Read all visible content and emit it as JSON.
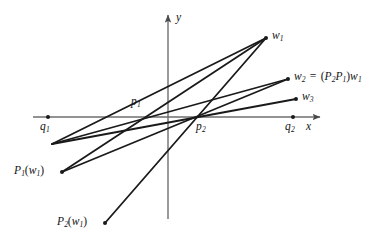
{
  "figure": {
    "type": "geometry-diagram",
    "background": "#ffffff",
    "ink_color": "#1a1a1a",
    "axis_color": "#6e6e6e",
    "width": 391,
    "height": 247,
    "axes": {
      "x_label": "x",
      "y_label": "y",
      "x_axis_y": 117,
      "x_axis_from": 33,
      "x_axis_to": 320,
      "y_axis_x": 168,
      "y_axis_from": 15,
      "y_axis_to": 219
    },
    "points": [
      {
        "name": "q1",
        "label_html": "q<sub>1</sub>",
        "x": 48,
        "y": 117,
        "label_x": 40,
        "label_y": 121,
        "dot": true
      },
      {
        "name": "q2",
        "label_html": "q<sub>2</sub>",
        "x": 293,
        "y": 117,
        "label_x": 285,
        "label_y": 121,
        "dot": true
      },
      {
        "name": "p1",
        "label_html": "p<sub>1</sub>",
        "x": 150,
        "y": 117,
        "label_x": 131,
        "label_y": 96,
        "dot": false
      },
      {
        "name": "p2",
        "label_html": "p<sub>2</sub>",
        "x": 198,
        "y": 117,
        "label_x": 196,
        "label_y": 121,
        "dot": false
      },
      {
        "name": "w1",
        "label_html": "w<sub>1</sub>",
        "x": 266,
        "y": 38,
        "label_x": 272,
        "label_y": 30,
        "dot": true
      },
      {
        "name": "w2",
        "label_html": "w<sub>2</sub> = (P<sub>2</sub>P<sub>1</sub>)w<sub>1</sub>",
        "x": 288,
        "y": 79,
        "label_x": 294,
        "label_y": 71,
        "dot": true
      },
      {
        "name": "w3",
        "label_html": "w<sub>3</sub>",
        "x": 296,
        "y": 99,
        "label_x": 302,
        "label_y": 91,
        "dot": true
      },
      {
        "name": "P1w1",
        "label_html": "P<sub>1</sub>(w<sub>1</sub>)",
        "x": 62,
        "y": 172,
        "label_x": 14,
        "label_y": 165,
        "dot": true
      },
      {
        "name": "P2w1",
        "label_html": "P<sub>2</sub>(w<sub>1</sub>)",
        "x": 105,
        "y": 223,
        "label_x": 57,
        "label_y": 216,
        "dot": true
      },
      {
        "name": "left-end",
        "label_html": "",
        "x": 52,
        "y": 144,
        "label_x": 0,
        "label_y": 0,
        "dot": false
      }
    ],
    "segments": [
      {
        "name": "w1-to-P1w1",
        "x1": 266,
        "y1": 38,
        "x2": 62,
        "y2": 172
      },
      {
        "name": "w1-to-P2w1",
        "x1": 266,
        "y1": 38,
        "x2": 105,
        "y2": 223
      },
      {
        "name": "w1-to-left-end",
        "x1": 266,
        "y1": 38,
        "x2": 52,
        "y2": 144
      },
      {
        "name": "w2-to-P1w1",
        "x1": 288,
        "y1": 79,
        "x2": 62,
        "y2": 172
      },
      {
        "name": "w2-to-left-end",
        "x1": 288,
        "y1": 79,
        "x2": 52,
        "y2": 144
      },
      {
        "name": "w3-to-left-end",
        "x1": 296,
        "y1": 99,
        "x2": 52,
        "y2": 144
      }
    ],
    "labels": {
      "q1": "q1",
      "q2": "q2",
      "p1": "p1",
      "p2": "p2",
      "w1": "w1",
      "w2_expression": "w2 = (P2P1)w1",
      "w3": "w3",
      "P1w1": "P1(w1)",
      "P2w1": "P2(w1)",
      "x_axis": "x",
      "y_axis": "y"
    }
  }
}
